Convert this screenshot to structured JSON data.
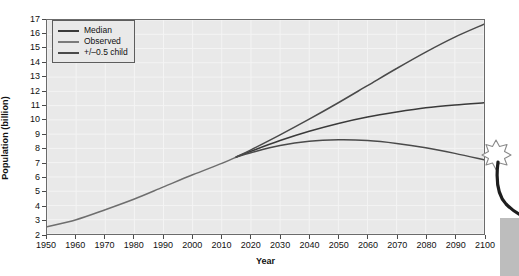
{
  "chart_data": {
    "type": "line",
    "title": "",
    "xlabel": "Year",
    "ylabel": "Population (billion)",
    "xlim": [
      1950,
      2100
    ],
    "ylim": [
      2,
      17
    ],
    "grid": true,
    "legend_position": "top-left",
    "xticks": [
      1950,
      1960,
      1970,
      1980,
      1990,
      2000,
      2010,
      2020,
      2030,
      2040,
      2050,
      2060,
      2070,
      2080,
      2090,
      2100
    ],
    "yticks": [
      2,
      3,
      4,
      5,
      6,
      7,
      8,
      9,
      10,
      11,
      12,
      13,
      14,
      15,
      16,
      17
    ],
    "series": [
      {
        "name": "Observed",
        "color": "#6e6e6e",
        "x": [
          1950,
          1960,
          1970,
          1980,
          1990,
          2000,
          2010,
          2015
        ],
        "values": [
          2.5,
          3.0,
          3.7,
          4.45,
          5.3,
          6.15,
          6.95,
          7.4
        ]
      },
      {
        "name": "Median",
        "color": "#3a3a3a",
        "x": [
          2015,
          2020,
          2030,
          2040,
          2050,
          2060,
          2070,
          2080,
          2090,
          2100
        ],
        "values": [
          7.4,
          7.8,
          8.55,
          9.2,
          9.75,
          10.2,
          10.55,
          10.85,
          11.05,
          11.2
        ]
      },
      {
        "name": "+/-0.5 child high",
        "color": "#4a4a4a",
        "x": [
          2015,
          2020,
          2030,
          2040,
          2050,
          2060,
          2070,
          2080,
          2090,
          2100
        ],
        "values": [
          7.4,
          7.9,
          8.95,
          10.05,
          11.2,
          12.4,
          13.6,
          14.75,
          15.8,
          16.7
        ]
      },
      {
        "name": "+/-0.5 child low",
        "color": "#4a4a4a",
        "x": [
          2015,
          2020,
          2030,
          2040,
          2050,
          2060,
          2070,
          2080,
          2090,
          2100
        ],
        "values": [
          7.4,
          7.7,
          8.2,
          8.5,
          8.6,
          8.55,
          8.35,
          8.05,
          7.65,
          7.2
        ]
      }
    ]
  },
  "legend": {
    "items": [
      {
        "label": "Median",
        "color": "#3a3a3a"
      },
      {
        "label": "Observed",
        "color": "#7a7a7a"
      },
      {
        "label": "+/–0.5 child",
        "color": "#4a4a4a"
      }
    ]
  },
  "axes": {
    "x_title": "Year",
    "y_title": "Population (billion)"
  },
  "overlay": {
    "star_icon": "sparkle-star-icon",
    "wand_icon": "magic-wand-icon"
  },
  "colors": {
    "plot_background": "#e9e9e9",
    "frame": "#6b6b6b",
    "gridline": "#f4f4f4",
    "text": "#111111"
  }
}
